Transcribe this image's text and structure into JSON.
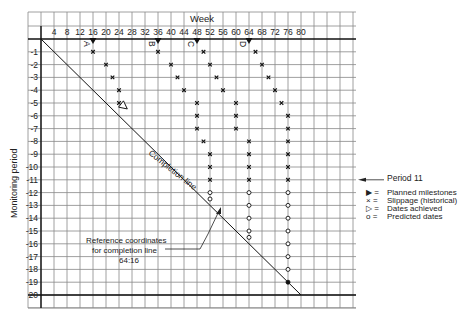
{
  "chart_data": {
    "type": "slip-chart",
    "title": "",
    "xlabel": "Week",
    "ylabel": "Monitoring period",
    "x_ticks": [
      4,
      8,
      12,
      16,
      20,
      24,
      28,
      32,
      36,
      40,
      44,
      48,
      52,
      56,
      60,
      64,
      68,
      72,
      76,
      80
    ],
    "y_ticks": [
      1,
      2,
      3,
      4,
      5,
      6,
      7,
      8,
      9,
      10,
      11,
      12,
      13,
      14,
      15,
      16,
      17,
      18,
      19,
      20
    ],
    "xlim": [
      0,
      80
    ],
    "ylim": [
      0,
      20
    ],
    "grid": true,
    "completion_line": {
      "label": "Completion line",
      "from": [
        0,
        0
      ],
      "to": [
        80,
        20
      ]
    },
    "milestones": [
      {
        "name": "A",
        "planned_week": 16,
        "slippage": [
          [
            16,
            1
          ],
          [
            20,
            2
          ],
          [
            22,
            3
          ],
          [
            24,
            4
          ],
          [
            24,
            5
          ]
        ],
        "achieved": [
          24,
          5
        ],
        "predicted": []
      },
      {
        "name": "B",
        "planned_week": 36,
        "slippage": [
          [
            36,
            1
          ],
          [
            40,
            2
          ],
          [
            42,
            3
          ],
          [
            44,
            4
          ],
          [
            48,
            5
          ],
          [
            48,
            6
          ],
          [
            48,
            7
          ],
          [
            50,
            8
          ],
          [
            52,
            9
          ],
          [
            52,
            10
          ],
          [
            52,
            11
          ]
        ],
        "achieved": null,
        "predicted": [
          [
            52,
            12
          ],
          [
            52,
            12.5
          ]
        ]
      },
      {
        "name": "C",
        "planned_week": 48,
        "slippage": [
          [
            50,
            1
          ],
          [
            52,
            2
          ],
          [
            54,
            3
          ],
          [
            56,
            4
          ],
          [
            60,
            5
          ],
          [
            60,
            6
          ],
          [
            60,
            7
          ],
          [
            64,
            8
          ],
          [
            64,
            9
          ],
          [
            64,
            10
          ],
          [
            64,
            11
          ]
        ],
        "achieved": null,
        "predicted": [
          [
            64,
            12
          ],
          [
            64,
            13
          ],
          [
            64,
            14
          ],
          [
            64,
            15
          ],
          [
            64,
            15.5
          ]
        ]
      },
      {
        "name": "D",
        "planned_week": 64,
        "slippage": [
          [
            66,
            1
          ],
          [
            68,
            2
          ],
          [
            70,
            3
          ],
          [
            72,
            4
          ],
          [
            74,
            5
          ],
          [
            76,
            6
          ],
          [
            76,
            7
          ],
          [
            76,
            8
          ],
          [
            76,
            9
          ],
          [
            76,
            10
          ],
          [
            76,
            11
          ]
        ],
        "achieved": null,
        "predicted": [
          [
            76,
            12
          ],
          [
            76,
            13
          ],
          [
            76,
            14
          ],
          [
            76,
            15
          ],
          [
            76,
            16
          ],
          [
            76,
            17
          ],
          [
            76,
            18
          ],
          [
            76,
            19
          ]
        ]
      }
    ],
    "annotations": [
      {
        "text": "Period 11",
        "arrow_to_period": 11
      },
      {
        "text": "Reference coordinates for completion line 64:16",
        "points_to": [
          56,
          14
        ]
      }
    ],
    "legend": [
      {
        "symbol": "▶",
        "label": "Planned milestones"
      },
      {
        "symbol": "×",
        "label": "Slippage (historical)"
      },
      {
        "symbol": "▷",
        "label": "Dates achieved"
      },
      {
        "symbol": "o",
        "label": "Predicted dates"
      }
    ]
  },
  "labels": {
    "week": "Week",
    "monitoring_period": "Monitoring period",
    "completion_line": "Completion line",
    "period_11": "Period 11",
    "ref_line1": "Reference coordinates",
    "ref_line2": "for completion line",
    "ref_line3": "64:16",
    "legend": [
      {
        "sym": "▶ =",
        "label": "Planned milestones"
      },
      {
        "sym": "× =",
        "label": "Slippage (historical)"
      },
      {
        "sym": "▷ =",
        "label": "Dates achieved"
      },
      {
        "sym": "o =",
        "label": "Predicted dates"
      }
    ],
    "milestone_letters": [
      "A",
      "B",
      "C",
      "D"
    ]
  },
  "colors": {
    "grid": "#888888",
    "ink": "#222222",
    "heavy": "#111111"
  }
}
